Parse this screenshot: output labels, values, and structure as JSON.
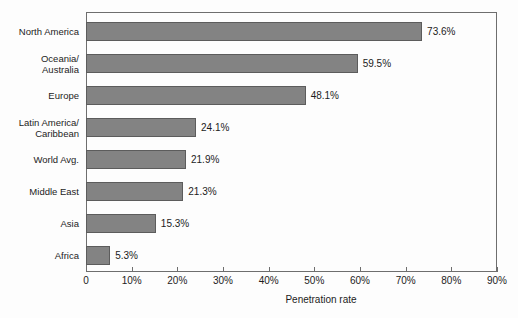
{
  "chart_data": {
    "type": "bar",
    "orientation": "horizontal",
    "title": "",
    "subtitle": "",
    "xlabel": "Penetration rate",
    "ylabel": "",
    "xlim": [
      0,
      90
    ],
    "xtick_labels": [
      "0",
      "10%",
      "20%",
      "30%",
      "40%",
      "50%",
      "60%",
      "70%",
      "80%",
      "90%"
    ],
    "xtick_values": [
      0,
      10,
      20,
      30,
      40,
      50,
      60,
      70,
      80,
      90
    ],
    "grid": false,
    "legend": false,
    "categories": [
      "North America",
      "Oceania/\nAustralia",
      "Europe",
      "Latin America/\nCaribbean",
      "World Avg.",
      "Middle East",
      "Asia",
      "Africa"
    ],
    "values": [
      73.6,
      59.5,
      48.1,
      24.1,
      21.9,
      21.3,
      15.3,
      5.3
    ],
    "value_labels": [
      "73.6%",
      "59.5%",
      "48.1%",
      "24.1%",
      "21.9%",
      "21.3%",
      "15.3%",
      "5.3%"
    ],
    "bar_color": "#838383",
    "bar_edge_color": "#5c5c5c",
    "frame_color": "#6e6e6e",
    "background_color": "#fdfdfd",
    "text_color": "#1c1c1c"
  }
}
